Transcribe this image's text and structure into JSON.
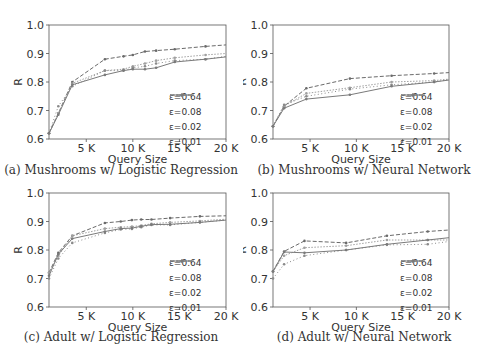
{
  "series_styles": [
    {
      "name": "ε=0.64",
      "color": "#6a6a6a",
      "dash": "4,2"
    },
    {
      "name": "ε=0.08",
      "color": "#a0a0a0",
      "dash": "1.5,1.5"
    },
    {
      "name": "ε=0.02",
      "color": "#8a8a8a",
      "dash": "1,2.5"
    },
    {
      "name": "ε=0.01",
      "color": "#7a7a7a",
      "dash": ""
    }
  ],
  "chart_data": [
    {
      "id": "a",
      "type": "line",
      "title": "(a) Mushrooms w/ Logistic Regression",
      "xlabel": "Query Size",
      "ylabel": "R",
      "xlim": [
        1000,
        20000
      ],
      "ylim": [
        0.6,
        1.0
      ],
      "xticks": [
        5000,
        10000,
        15000,
        20000
      ],
      "xtick_labels": [
        "5 K",
        "10 K",
        "15 K",
        "20 K"
      ],
      "yticks": [
        0.6,
        0.7,
        0.8,
        0.9,
        1.0
      ],
      "ytick_labels": [
        "0.6",
        "0.7",
        "0.8",
        "0.9",
        "1.0"
      ],
      "grid": false,
      "legend_position": "lower right",
      "series": [
        {
          "name": "ε=0.64",
          "x": [
            1000,
            2000,
            3500,
            7000,
            9000,
            10000,
            11300,
            12500,
            14500,
            17800,
            20000
          ],
          "y": [
            0.62,
            0.69,
            0.8,
            0.88,
            0.89,
            0.895,
            0.907,
            0.91,
            0.915,
            0.925,
            0.93
          ]
        },
        {
          "name": "ε=0.08",
          "x": [
            1000,
            2000,
            3500,
            7000,
            9000,
            10000,
            11300,
            12500,
            14500,
            17800,
            20000
          ],
          "y": [
            0.62,
            0.69,
            0.795,
            0.84,
            0.845,
            0.855,
            0.865,
            0.875,
            0.885,
            0.895,
            0.9
          ]
        },
        {
          "name": "ε=0.02",
          "x": [
            1000,
            2000,
            3500,
            7000,
            9000,
            10000,
            11300,
            12500,
            14500,
            17800,
            20000
          ],
          "y": [
            0.62,
            0.715,
            0.785,
            0.84,
            0.84,
            0.85,
            0.855,
            0.865,
            0.875,
            0.88,
            0.89
          ]
        },
        {
          "name": "ε=0.01",
          "x": [
            1000,
            2000,
            3500,
            7000,
            9000,
            10000,
            11300,
            12500,
            14500,
            17800,
            20000
          ],
          "y": [
            0.62,
            0.685,
            0.79,
            0.825,
            0.84,
            0.845,
            0.845,
            0.85,
            0.87,
            0.88,
            0.888
          ]
        }
      ]
    },
    {
      "id": "b",
      "type": "line",
      "title": "(b) Mushrooms w/ Neural Network",
      "xlabel": "Query Size",
      "ylabel": "R",
      "xlim": [
        1000,
        20000
      ],
      "ylim": [
        0.6,
        1.0
      ],
      "xticks": [
        5000,
        10000,
        15000,
        20000
      ],
      "xtick_labels": [
        "5 K",
        "10 K",
        "15 K",
        "20 K"
      ],
      "yticks": [
        0.6,
        0.7,
        0.8,
        0.9,
        1.0
      ],
      "ytick_labels": [
        "0.6",
        "0.7",
        "0.8",
        "0.9",
        "1.0"
      ],
      "grid": false,
      "legend_position": "lower right",
      "series": [
        {
          "name": "ε=0.64",
          "x": [
            1000,
            2200,
            4600,
            9300,
            13800,
            18400,
            20000
          ],
          "y": [
            0.645,
            0.715,
            0.778,
            0.812,
            0.822,
            0.83,
            0.833
          ]
        },
        {
          "name": "ε=0.08",
          "x": [
            1000,
            2200,
            4600,
            9300,
            13800,
            18400,
            20000
          ],
          "y": [
            0.645,
            0.715,
            0.76,
            0.78,
            0.8,
            0.805,
            0.81
          ]
        },
        {
          "name": "ε=0.02",
          "x": [
            1000,
            2200,
            4600,
            9300,
            13800,
            18400,
            20000
          ],
          "y": [
            0.645,
            0.72,
            0.75,
            0.775,
            0.79,
            0.8,
            0.808
          ]
        },
        {
          "name": "ε=0.01",
          "x": [
            1000,
            2200,
            4600,
            9300,
            13800,
            18400,
            20000
          ],
          "y": [
            0.645,
            0.708,
            0.74,
            0.755,
            0.785,
            0.8,
            0.807
          ]
        }
      ]
    },
    {
      "id": "c",
      "type": "line",
      "title": "(c) Adult w/ Logistic Regression",
      "xlabel": "Query Size",
      "ylabel": "R",
      "xlim": [
        1000,
        20000
      ],
      "ylim": [
        0.6,
        1.0
      ],
      "xticks": [
        5000,
        10000,
        15000,
        20000
      ],
      "xtick_labels": [
        "5 K",
        "10 K",
        "15 K",
        "20 K"
      ],
      "yticks": [
        0.6,
        0.7,
        0.8,
        0.9,
        1.0
      ],
      "ytick_labels": [
        "0.6",
        "0.7",
        "0.8",
        "0.9",
        "1.0"
      ],
      "grid": false,
      "legend_position": "lower right",
      "series": [
        {
          "name": "ε=0.64",
          "x": [
            1000,
            2000,
            3500,
            7000,
            8700,
            9900,
            10900,
            12000,
            14000,
            17200,
            20000
          ],
          "y": [
            0.72,
            0.79,
            0.85,
            0.895,
            0.9,
            0.905,
            0.907,
            0.907,
            0.912,
            0.918,
            0.92
          ]
        },
        {
          "name": "ε=0.08",
          "x": [
            1000,
            2000,
            3500,
            7000,
            8700,
            9900,
            10900,
            12000,
            14000,
            17200,
            20000
          ],
          "y": [
            0.72,
            0.78,
            0.85,
            0.875,
            0.88,
            0.882,
            0.886,
            0.892,
            0.897,
            0.902,
            0.908
          ]
        },
        {
          "name": "ε=0.02",
          "x": [
            1000,
            2000,
            3500,
            7000,
            8700,
            9900,
            10900,
            12000,
            14000,
            17200,
            20000
          ],
          "y": [
            0.7,
            0.77,
            0.825,
            0.86,
            0.872,
            0.874,
            0.88,
            0.888,
            0.888,
            0.897,
            0.905
          ]
        },
        {
          "name": "ε=0.01",
          "x": [
            1000,
            2000,
            3500,
            7000,
            8700,
            9900,
            10900,
            12000,
            14000,
            17200,
            20000
          ],
          "y": [
            0.71,
            0.785,
            0.84,
            0.865,
            0.875,
            0.877,
            0.883,
            0.889,
            0.89,
            0.897,
            0.905
          ]
        }
      ]
    },
    {
      "id": "d",
      "type": "line",
      "title": "(d) Adult w/ Neural Network",
      "xlabel": "Query Size",
      "ylabel": "R",
      "xlim": [
        1000,
        20000
      ],
      "ylim": [
        0.6,
        1.0
      ],
      "xticks": [
        5000,
        10000,
        15000,
        20000
      ],
      "xtick_labels": [
        "5 K",
        "10 K",
        "15 K",
        "20 K"
      ],
      "yticks": [
        0.6,
        0.7,
        0.8,
        0.9,
        1.0
      ],
      "ytick_labels": [
        "0.6",
        "0.7",
        "0.8",
        "0.9",
        "1.0"
      ],
      "grid": false,
      "legend_position": "lower right",
      "series": [
        {
          "name": "ε=0.64",
          "x": [
            1000,
            2200,
            4400,
            8900,
            13300,
            17700,
            20000
          ],
          "y": [
            0.725,
            0.795,
            0.832,
            0.825,
            0.85,
            0.865,
            0.87
          ]
        },
        {
          "name": "ε=0.08",
          "x": [
            1000,
            2200,
            4400,
            8900,
            13300,
            17700,
            20000
          ],
          "y": [
            0.725,
            0.78,
            0.808,
            0.815,
            0.835,
            0.835,
            0.835
          ]
        },
        {
          "name": "ε=0.02",
          "x": [
            1000,
            2200,
            4400,
            8900,
            13300,
            17700,
            20000
          ],
          "y": [
            0.7,
            0.75,
            0.78,
            0.8,
            0.818,
            0.82,
            0.83
          ]
        },
        {
          "name": "ε=0.01",
          "x": [
            1000,
            2200,
            4400,
            8900,
            13300,
            17700,
            20000
          ],
          "y": [
            0.725,
            0.793,
            0.79,
            0.8,
            0.82,
            0.835,
            0.843
          ]
        }
      ]
    }
  ]
}
